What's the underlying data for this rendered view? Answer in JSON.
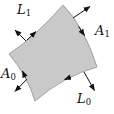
{
  "figure": {
    "type": "surface-patch-diagram",
    "background_color": "#ffffff",
    "patch_fill": "#c9c9c9",
    "patch_stroke": "#979797",
    "line_color": "#111111",
    "labels": {
      "top_left": {
        "main": "L",
        "sub": "1"
      },
      "right": {
        "main": "A",
        "sub": "1"
      },
      "left": {
        "main": "A",
        "sub": "0"
      },
      "bottom": {
        "main": "L",
        "sub": "0"
      }
    }
  }
}
